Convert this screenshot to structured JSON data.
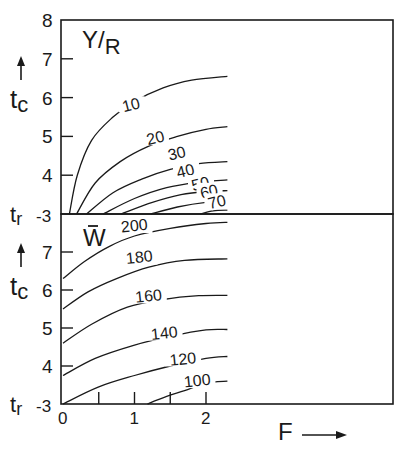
{
  "chart_data": [
    {
      "type": "contour",
      "panel": "top",
      "title": "Y/R",
      "title_parts": {
        "num": "Y",
        "den": "R"
      },
      "xlabel": "F",
      "ylabel": "t_c",
      "ylabel_parts": {
        "main": "t",
        "sub": "c"
      },
      "ylim": [
        3,
        8
      ],
      "xlim": [
        0,
        2.3
      ],
      "y_ticks": [
        8,
        7,
        6,
        5,
        4
      ],
      "y_tick_labels": [
        "8",
        "7",
        "6",
        "5",
        "4"
      ],
      "y_baseline_label": {
        "main": "t",
        "sub": "r",
        "value": "-3"
      },
      "contours": [
        {
          "level": 10,
          "label": "10",
          "points": [
            [
              0.09,
              3.0
            ],
            [
              0.2,
              4.0
            ],
            [
              0.4,
              4.9
            ],
            [
              0.7,
              5.5
            ],
            [
              1.0,
              5.9
            ],
            [
              1.4,
              6.25
            ],
            [
              1.8,
              6.45
            ],
            [
              2.3,
              6.55
            ]
          ],
          "label_at": [
            0.96,
            5.75
          ]
        },
        {
          "level": 20,
          "label": "20",
          "points": [
            [
              0.19,
              3.0
            ],
            [
              0.45,
              3.8
            ],
            [
              0.8,
              4.35
            ],
            [
              1.2,
              4.75
            ],
            [
              1.6,
              5.0
            ],
            [
              2.0,
              5.18
            ],
            [
              2.3,
              5.25
            ]
          ],
          "label_at": [
            1.3,
            4.9
          ]
        },
        {
          "level": 30,
          "label": "30",
          "points": [
            [
              0.33,
              3.0
            ],
            [
              0.7,
              3.55
            ],
            [
              1.1,
              3.9
            ],
            [
              1.5,
              4.15
            ],
            [
              1.9,
              4.3
            ],
            [
              2.3,
              4.35
            ]
          ],
          "label_at": [
            1.6,
            4.5
          ]
        },
        {
          "level": 40,
          "label": "40",
          "points": [
            [
              0.56,
              3.0
            ],
            [
              1.0,
              3.4
            ],
            [
              1.45,
              3.68
            ],
            [
              1.9,
              3.82
            ],
            [
              2.3,
              3.88
            ]
          ],
          "label_at": [
            1.72,
            4.05
          ]
        },
        {
          "level": 50,
          "label": "50",
          "points": [
            [
              0.81,
              3.0
            ],
            [
              1.25,
              3.3
            ],
            [
              1.65,
              3.5
            ],
            [
              2.0,
              3.58
            ],
            [
              2.3,
              3.6
            ]
          ],
          "label_at": [
            1.93,
            3.72
          ]
        },
        {
          "level": 60,
          "label": "60",
          "points": [
            [
              1.23,
              3.0
            ],
            [
              1.6,
              3.18
            ],
            [
              2.0,
              3.3
            ],
            [
              2.3,
              3.33
            ]
          ],
          "label_at": [
            2.05,
            3.52
          ]
        },
        {
          "level": 70,
          "label": "70",
          "points": [
            [
              1.92,
              3.0
            ],
            [
              2.1,
              3.08
            ],
            [
              2.3,
              3.1
            ]
          ],
          "label_at": [
            2.16,
            3.25
          ]
        }
      ]
    },
    {
      "type": "contour",
      "panel": "bottom",
      "title": "W̅",
      "title_parts": {
        "main": "W",
        "overbar": true
      },
      "xlabel": "F",
      "ylabel": "t_c",
      "ylabel_parts": {
        "main": "t",
        "sub": "c"
      },
      "ylim": [
        3,
        8
      ],
      "xlim": [
        0,
        2.3
      ],
      "x_ticks": [
        0,
        0.5,
        1,
        1.5,
        2
      ],
      "x_tick_labels": [
        "0",
        "",
        "1",
        "",
        "2"
      ],
      "y_ticks": [
        7,
        6,
        5,
        4
      ],
      "y_tick_labels": [
        "7",
        "6",
        "5",
        "4"
      ],
      "y_baseline_label": {
        "main": "t",
        "sub": "r",
        "value": "-3"
      },
      "contours": [
        {
          "level": 200,
          "label": "200",
          "points": [
            [
              0.0,
              6.3
            ],
            [
              0.3,
              6.75
            ],
            [
              0.65,
              7.15
            ],
            [
              1.0,
              7.42
            ],
            [
              1.5,
              7.62
            ],
            [
              2.0,
              7.75
            ],
            [
              2.3,
              7.78
            ]
          ],
          "label_at": [
            1.0,
            7.63
          ]
        },
        {
          "level": 180,
          "label": "180",
          "points": [
            [
              0.0,
              5.5
            ],
            [
              0.35,
              5.95
            ],
            [
              0.75,
              6.3
            ],
            [
              1.2,
              6.6
            ],
            [
              1.7,
              6.78
            ],
            [
              2.3,
              6.82
            ]
          ],
          "label_at": [
            1.07,
            6.8
          ]
        },
        {
          "level": 160,
          "label": "160",
          "points": [
            [
              0.0,
              4.6
            ],
            [
              0.4,
              5.1
            ],
            [
              0.9,
              5.55
            ],
            [
              1.4,
              5.75
            ],
            [
              1.9,
              5.85
            ],
            [
              2.3,
              5.86
            ]
          ],
          "label_at": [
            1.2,
            5.78
          ]
        },
        {
          "level": 140,
          "label": "140",
          "points": [
            [
              0.0,
              3.75
            ],
            [
              0.45,
              4.2
            ],
            [
              1.0,
              4.55
            ],
            [
              1.5,
              4.78
            ],
            [
              2.0,
              4.95
            ],
            [
              2.3,
              4.96
            ]
          ],
          "label_at": [
            1.42,
            4.8
          ]
        },
        {
          "level": 120,
          "label": "120",
          "points": [
            [
              0.0,
              3.0
            ],
            [
              0.5,
              3.45
            ],
            [
              1.0,
              3.75
            ],
            [
              1.5,
              4.0
            ],
            [
              2.0,
              4.2
            ],
            [
              2.3,
              4.25
            ]
          ],
          "label_at": [
            1.68,
            4.12
          ]
        },
        {
          "level": 100,
          "label": "100",
          "points": [
            [
              1.18,
              3.0
            ],
            [
              1.45,
              3.2
            ],
            [
              1.7,
              3.35
            ],
            [
              2.0,
              3.55
            ],
            [
              2.3,
              3.6
            ]
          ],
          "label_at": [
            1.88,
            3.55
          ]
        }
      ]
    }
  ],
  "figure": {
    "xlabel": "F",
    "xlabel_arrow": "right-arrow-icon",
    "ylabel_arrow": "up-arrow-icon"
  }
}
